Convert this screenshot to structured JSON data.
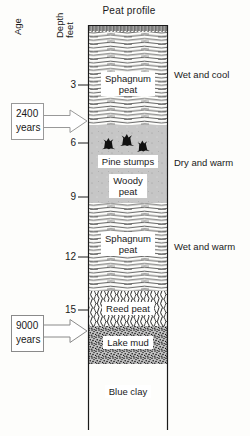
{
  "figure": {
    "title": "Peat profile",
    "age_axis_label": "Age",
    "depth_axis_label_lines": [
      "Depth",
      "feet"
    ],
    "depth_unit": "feet",
    "depth_ticks": [
      {
        "label": "3"
      },
      {
        "label": "6"
      },
      {
        "label": "9"
      },
      {
        "label": "12"
      },
      {
        "label": "15"
      }
    ]
  },
  "column": {
    "layers": [
      {
        "name": "surface-crust",
        "texture": "vertical-hatch",
        "label_lines": [],
        "depth_top_ft": 0,
        "depth_bottom_ft": 0.4
      },
      {
        "name": "sphagnum-peat-upper",
        "texture": "wavy-lines",
        "label_lines": [
          "Sphagnum",
          "peat"
        ],
        "depth_top_ft": 0.4,
        "depth_bottom_ft": 5.2
      },
      {
        "name": "woody-peat",
        "texture": "solid-gray",
        "stump_icon_count": 3,
        "sublabel": "Pine stumps",
        "label_lines": [
          "Woody",
          "peat"
        ],
        "depth_top_ft": 5.2,
        "depth_bottom_ft": 9.3
      },
      {
        "name": "sphagnum-peat-lower",
        "texture": "wavy-lines",
        "label_lines": [
          "Sphagnum",
          "peat"
        ],
        "depth_top_ft": 9.3,
        "depth_bottom_ft": 14.0
      },
      {
        "name": "reed-peat",
        "texture": "dense-scribble",
        "label_lines": [
          "Reed peat"
        ],
        "depth_top_ft": 14.0,
        "depth_bottom_ft": 15.9
      },
      {
        "name": "lake-mud",
        "texture": "dark-stipple",
        "label_lines": [
          "Lake mud"
        ],
        "depth_top_ft": 15.9,
        "depth_bottom_ft": 17.9
      },
      {
        "name": "blue-clay",
        "texture": "plain",
        "label_lines": [
          "Blue clay"
        ],
        "depth_top_ft": 17.9
      }
    ]
  },
  "climate_annotations": [
    {
      "text": "Wet and cool",
      "at_depth_ft": 2.5
    },
    {
      "text": "Dry and warm",
      "at_depth_ft": 7.3
    },
    {
      "text": "Wet and warm",
      "at_depth_ft": 11.7
    }
  ],
  "age_callouts": [
    {
      "lines": [
        "2400",
        "years"
      ],
      "points_to_depth_ft": 5.2
    },
    {
      "lines": [
        "9000",
        "years"
      ],
      "points_to_depth_ft": 16.2
    }
  ],
  "colors": {
    "paper": "#fdfdfb",
    "ink": "#1a1a1a",
    "woody_peat_gray": "#c6c6c6",
    "lake_mud_gray": "#c2c2c2",
    "callout_outline": "#999999"
  }
}
